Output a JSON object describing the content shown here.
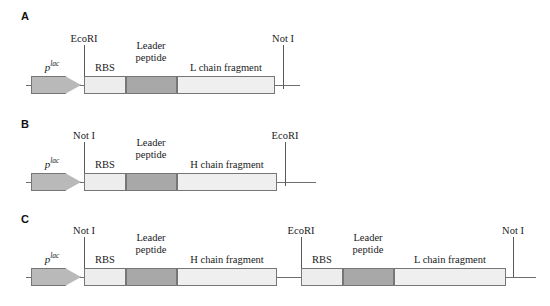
{
  "figure": {
    "type": "gene-construct-diagram",
    "colors": {
      "promoter_fill": "#b9b9b9",
      "rbs_fill": "#ededed",
      "leader_fill": "#a8a8a8",
      "chain_fill": "#efefef",
      "outline": "#767676",
      "backbone": "#6e6e6e",
      "text": "#1a1a1a"
    }
  },
  "panels": [
    {
      "letter": "A",
      "promoter_label_html": "p<sup>lac</sup>",
      "sites": [
        {
          "name": "EcoRI"
        },
        {
          "name": "Not I"
        }
      ],
      "segments": [
        {
          "name": "RBS",
          "label": "RBS",
          "lines": [
            "RBS"
          ]
        },
        {
          "name": "leader-peptide",
          "label": "Leader peptide",
          "lines": [
            "Leader",
            "peptide"
          ]
        },
        {
          "name": "L-chain-fragment",
          "label": "L chain fragment",
          "lines": [
            "L chain fragment"
          ]
        }
      ]
    },
    {
      "letter": "B",
      "promoter_label_html": "p<sup>lac</sup>",
      "sites": [
        {
          "name": "Not I"
        },
        {
          "name": "EcoRI"
        }
      ],
      "segments": [
        {
          "name": "RBS",
          "label": "RBS",
          "lines": [
            "RBS"
          ]
        },
        {
          "name": "leader-peptide",
          "label": "Leader peptide",
          "lines": [
            "Leader",
            "peptide"
          ]
        },
        {
          "name": "H-chain-fragment",
          "label": "H chain fragment",
          "lines": [
            "H chain fragment"
          ]
        }
      ]
    },
    {
      "letter": "C",
      "promoter_label_html": "p<sup>lac</sup>",
      "sites": [
        {
          "name": "Not I"
        },
        {
          "name": "EcoRI"
        },
        {
          "name": "Not I"
        }
      ],
      "segments": [
        {
          "name": "RBS",
          "label": "RBS",
          "lines": [
            "RBS"
          ]
        },
        {
          "name": "leader-peptide",
          "label": "Leader peptide",
          "lines": [
            "Leader",
            "peptide"
          ]
        },
        {
          "name": "H-chain-fragment",
          "label": "H chain fragment",
          "lines": [
            "H chain fragment"
          ]
        },
        {
          "name": "RBS",
          "label": "RBS",
          "lines": [
            "RBS"
          ]
        },
        {
          "name": "leader-peptide",
          "label": "Leader peptide",
          "lines": [
            "Leader",
            "peptide"
          ]
        },
        {
          "name": "L-chain-fragment",
          "label": "L chain fragment",
          "lines": [
            "L chain fragment"
          ]
        }
      ]
    }
  ]
}
